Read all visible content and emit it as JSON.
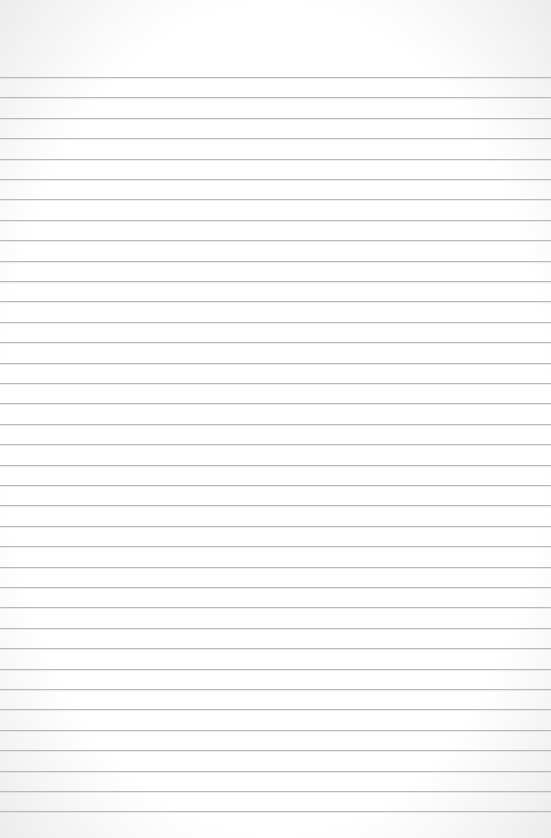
{
  "paper": {
    "type": "lined-paper",
    "background_color": "#ffffff",
    "line_color": "#b9b9b9",
    "first_line_y": 77,
    "line_spacing": 20.4,
    "line_count": 37
  }
}
